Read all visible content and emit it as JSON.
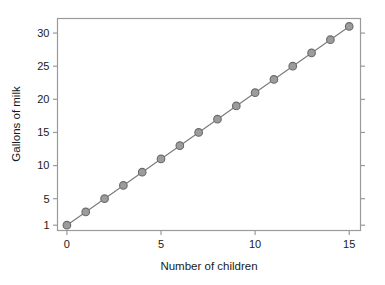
{
  "chart_data": {
    "type": "line",
    "title": "",
    "subtitle": "",
    "xlabel": "Number of children",
    "ylabel": "Gallons of milk",
    "x": [
      0,
      1,
      2,
      3,
      4,
      5,
      6,
      7,
      8,
      9,
      10,
      11,
      12,
      13,
      14,
      15
    ],
    "values": [
      1,
      3,
      5,
      7,
      9,
      11,
      13,
      15,
      17,
      19,
      21,
      23,
      25,
      27,
      29,
      31
    ],
    "series": [
      {
        "name": "Gallons of milk",
        "values": [
          1,
          3,
          5,
          7,
          9,
          11,
          13,
          15,
          17,
          19,
          21,
          23,
          25,
          27,
          29,
          31
        ]
      }
    ],
    "xlim": [
      -0.5,
      15.6
    ],
    "ylim": [
      0.2,
      32.2
    ],
    "xticks": [
      0,
      5,
      10,
      15
    ],
    "xtick_labels": [
      "0",
      "5",
      "10",
      "15"
    ],
    "yticks": [
      1,
      5,
      10,
      15,
      20,
      25,
      30
    ],
    "ytick_labels": [
      "1",
      "5",
      "10",
      "15",
      "20",
      "25",
      "30"
    ],
    "grid": false,
    "legend": null,
    "legend_position": "none",
    "marker": "circle",
    "marker_fill": "#9c9c9c",
    "marker_edge": "#6a6a6a",
    "line_color": "#7a7a7a",
    "axis_color": "#9a9a9a",
    "background": "#ffffff",
    "annotations": [],
    "relationship": "y = 2x + 1"
  }
}
